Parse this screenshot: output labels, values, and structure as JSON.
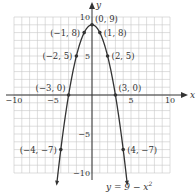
{
  "chart_data": {
    "type": "line",
    "title": "",
    "equation": "y = 9 − x²",
    "equation_parts": {
      "lhs": "y = 9 − x",
      "exp": "2"
    },
    "xlabel": "x",
    "ylabel": "y",
    "xlim": [
      -10,
      10
    ],
    "ylim": [
      -10,
      10
    ],
    "grid": true,
    "grid_step": 1,
    "x_ticks": [
      {
        "value": -10,
        "label": "−10"
      },
      {
        "value": -5,
        "label": "−5"
      },
      {
        "value": 5,
        "label": "5"
      },
      {
        "value": 10,
        "label": "10"
      }
    ],
    "y_ticks": [
      {
        "value": 10,
        "label": "10"
      },
      {
        "value": 5,
        "label": "5"
      },
      {
        "value": -5,
        "label": "−5"
      },
      {
        "value": -10,
        "label": "−10"
      }
    ],
    "series": [
      {
        "name": "y = 9 − x²",
        "function": "9 - x^2",
        "domain": [
          -4.5,
          4.5
        ],
        "arrows_at_ends": true
      }
    ],
    "points": [
      {
        "x": 0,
        "y": 9,
        "label": "(0, 9)"
      },
      {
        "x": -1,
        "y": 8,
        "label": "(−1, 8)"
      },
      {
        "x": 1,
        "y": 8,
        "label": "(1, 8)"
      },
      {
        "x": -2,
        "y": 5,
        "label": "(−2, 5)"
      },
      {
        "x": 2,
        "y": 5,
        "label": "(2, 5)"
      },
      {
        "x": -3,
        "y": 0,
        "label": "(−3, 0)"
      },
      {
        "x": 3,
        "y": 0,
        "label": "(3, 0)"
      },
      {
        "x": -4,
        "y": -7,
        "label": "(−4, −7)"
      },
      {
        "x": 4,
        "y": -7,
        "label": "(4, −7)"
      }
    ],
    "colors": {
      "curve": "#333333",
      "grid": "#c8c8c8",
      "axis": "#333333",
      "text": "#333333"
    }
  }
}
